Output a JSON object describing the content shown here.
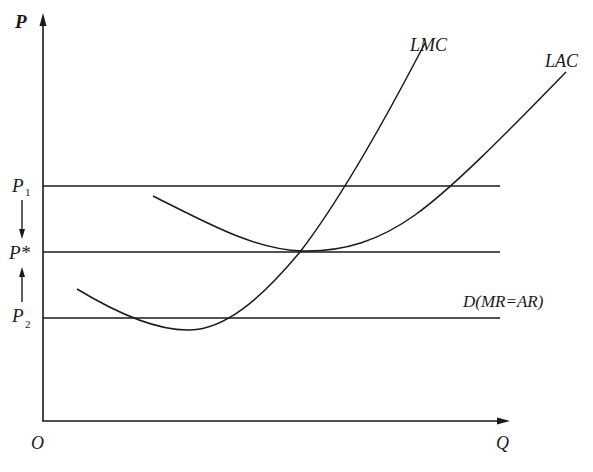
{
  "diagram": {
    "colors": {
      "ink": "#1a1a1a",
      "background": "#ffffff"
    },
    "axes": {
      "y_label": "P",
      "x_label": "Q",
      "origin_label": "O"
    },
    "price_levels": [
      {
        "id": "p1",
        "label": "P",
        "subscript": "1"
      },
      {
        "id": "pstar",
        "label": "P*",
        "subscript": ""
      },
      {
        "id": "p2",
        "label": "P",
        "subscript": "2"
      }
    ],
    "curves": {
      "lmc": {
        "label": "LMC"
      },
      "lac": {
        "label": "LAC"
      },
      "demand": {
        "label": "D(MR=AR)"
      }
    },
    "annotations": {
      "arrow_down": "price adjusts down from P1 to P*",
      "arrow_up": "price adjusts up from P2 to P*"
    }
  }
}
